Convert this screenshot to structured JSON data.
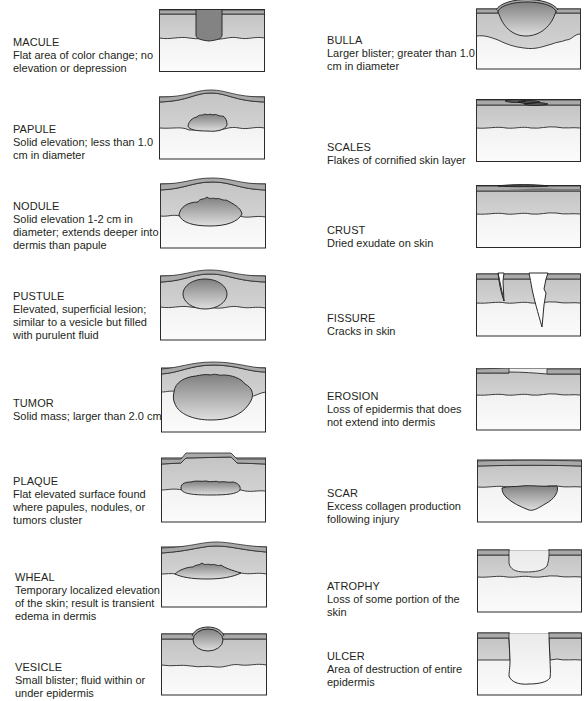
{
  "colors": {
    "epidermis": "#a9a9a9",
    "dermis": "#cfcfcf",
    "subcutis_top": "#ececec",
    "subcutis_bottom": "#fafafa",
    "lesion_dark": "#8a8a8a",
    "lesion_light": "#d9d9d9",
    "outline": "#2a2a2a"
  },
  "left_column": [
    {
      "term": "MACULE",
      "desc": "Flat area of color change; no elevation or depression"
    },
    {
      "term": "PAPULE",
      "desc": "Solid elevation; less than 1.0 cm in diameter"
    },
    {
      "term": "NODULE",
      "desc": "Solid elevation 1-2 cm in diameter; extends deeper into dermis than papule"
    },
    {
      "term": "PUSTULE",
      "desc": "Elevated, superficial lesion; similar to a vesicle but filled with purulent fluid"
    },
    {
      "term": "TUMOR",
      "desc": "Solid mass; larger than 2.0 cm"
    },
    {
      "term": "PLAQUE",
      "desc": "Flat elevated surface found where papules, nodules, or tumors cluster"
    },
    {
      "term": "WHEAL",
      "desc": "Temporary localized elevation of the skin; result is transient edema in dermis"
    },
    {
      "term": "VESICLE",
      "desc": "Small blister; fluid within or under epidermis"
    }
  ],
  "right_column": [
    {
      "term": "BULLA",
      "desc": "Larger blister; greater than 1.0 cm in diameter"
    },
    {
      "term": "SCALES",
      "desc": "Flakes of cornified skin layer"
    },
    {
      "term": "CRUST",
      "desc": "Dried exudate on skin"
    },
    {
      "term": "FISSURE",
      "desc": "Cracks in skin"
    },
    {
      "term": "EROSION",
      "desc": "Loss of epidermis that does not extend into dermis"
    },
    {
      "term": "SCAR",
      "desc": "Excess collagen production following injury"
    },
    {
      "term": "ATROPHY",
      "desc": "Loss of some portion of the skin"
    },
    {
      "term": "ULCER",
      "desc": "Area of destruction of entire epidermis"
    }
  ]
}
